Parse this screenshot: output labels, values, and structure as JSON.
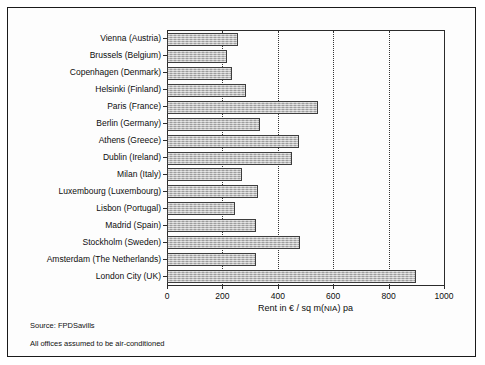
{
  "chart_data": {
    "type": "bar",
    "orientation": "horizontal",
    "title": "",
    "xlabel": "Rent in € / sq m(NIA) pa",
    "ylabel": "",
    "xlim": [
      0,
      1000
    ],
    "xticks": [
      0,
      200,
      400,
      600,
      800,
      1000
    ],
    "xtick_labels": [
      "0",
      "200",
      "400",
      "600",
      "800",
      "1000"
    ],
    "grid": "vertical dotted gridlines at 200, 400, 600, 800",
    "legend": "none",
    "categories": [
      "Vienna (Austria)",
      "Brussels (Belgium)",
      "Copenhagen (Denmark)",
      "Helsinki (Finland)",
      "Paris (France)",
      "Berlin (Germany)",
      "Athens (Greece)",
      "Dublin (Ireland)",
      "Milan (Italy)",
      "Luxembourg (Luxembourg)",
      "Lisbon (Portugal)",
      "Madrid (Spain)",
      "Stockholm (Sweden)",
      "Amsterdam (The Netherlands)",
      "London City (UK)"
    ],
    "values": [
      255,
      215,
      235,
      285,
      545,
      335,
      475,
      450,
      270,
      330,
      245,
      320,
      480,
      320,
      900
    ],
    "bar_color": "#b0b0b0",
    "bar_edge_color": "#3d3d3d"
  },
  "notes": {
    "source": "Source: FPDSavills",
    "aircon": "All offices assumed to be air-conditioned"
  },
  "axis_title_parts": {
    "main": "Rent in € / sq m(",
    "nia": "NIA",
    "tail": ") pa"
  }
}
